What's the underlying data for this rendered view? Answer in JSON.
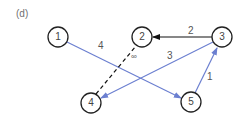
{
  "panel_label": "(d)",
  "colors": {
    "node_stroke": "#222222",
    "black_edge": "#111111",
    "blue_edge": "#6b7fd0",
    "label": "#555555"
  },
  "nodes": [
    {
      "id": "1",
      "label": "1",
      "x": 58,
      "y": 37
    },
    {
      "id": "2",
      "label": "2",
      "x": 142,
      "y": 37
    },
    {
      "id": "3",
      "label": "3",
      "x": 222,
      "y": 37
    },
    {
      "id": "4",
      "label": "4",
      "x": 91,
      "y": 103
    },
    {
      "id": "5",
      "label": "5",
      "x": 191,
      "y": 102
    }
  ],
  "edges": [
    {
      "from": "1",
      "to": "5",
      "weight": "4",
      "style": "solid",
      "color": "blue"
    },
    {
      "from": "3",
      "to": "2",
      "weight": "2",
      "style": "solid",
      "color": "black"
    },
    {
      "from": "3",
      "to": "4",
      "weight": "3",
      "style": "solid",
      "color": "blue"
    },
    {
      "from": "4",
      "to": "2",
      "weight": "∞",
      "style": "dashed",
      "color": "black"
    },
    {
      "from": "5",
      "to": "3",
      "weight": "1",
      "style": "solid",
      "color": "blue"
    }
  ]
}
